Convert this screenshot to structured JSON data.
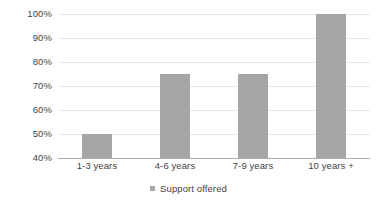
{
  "chart_data": {
    "type": "bar",
    "title": "",
    "subtitle": "",
    "xlabel": "",
    "ylabel": "",
    "categories": [
      "1-3 years",
      "4-6 years",
      "7-9 years",
      "10 years +"
    ],
    "series": [
      {
        "name": "Support offered",
        "values": [
          50,
          75,
          75,
          100
        ],
        "color": "#a6a6a6"
      }
    ],
    "values": [
      50,
      75,
      75,
      100
    ],
    "ylim": [
      40,
      100
    ],
    "ytick_values": [
      40,
      50,
      60,
      70,
      80,
      90,
      100
    ],
    "ytick_labels": [
      "40%",
      "50%",
      "60%",
      "70%",
      "80%",
      "90%",
      "100%"
    ],
    "value_unit": "%",
    "grid": true,
    "grid_axis": "y",
    "grid_color": "#e7e7e7",
    "axis_line_color": "#b0b0b0",
    "legend_position": "bottom",
    "legend_entries": [
      {
        "label": "Support offered",
        "color": "#a6a6a6",
        "marker": "square"
      }
    ],
    "background_color": "#ffffff",
    "text_color": "#3f3f3f"
  }
}
